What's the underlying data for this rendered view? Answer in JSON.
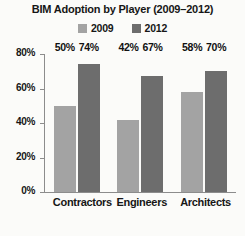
{
  "chart_data": {
    "type": "bar",
    "title": "BIM Adoption by Player (2009–2012)",
    "xlabel": "",
    "ylabel": "",
    "categories": [
      "Contractors",
      "Engineers",
      "Architects"
    ],
    "series": [
      {
        "name": "2009",
        "color": "#a3a3a3",
        "values": [
          50,
          42,
          58
        ],
        "labels": [
          "50%",
          "42%",
          "58%"
        ]
      },
      {
        "name": "2012",
        "color": "#6d6d6d",
        "values": [
          74,
          67,
          70
        ],
        "labels": [
          "74%",
          "67%",
          "70%"
        ]
      }
    ],
    "ylim": [
      0,
      80
    ],
    "yticks": [
      0,
      20,
      40,
      60,
      80
    ],
    "ytick_labels": [
      "0%",
      "20%",
      "40%",
      "60%",
      "80%"
    ],
    "grid": false,
    "legend_position": "top-center",
    "value_labels": true
  },
  "legend": {
    "entries": [
      {
        "label": "2009",
        "color": "#a3a3a3"
      },
      {
        "label": "2012",
        "color": "#6d6d6d"
      }
    ]
  },
  "axis": {
    "line_color": "#8c8c8c"
  }
}
